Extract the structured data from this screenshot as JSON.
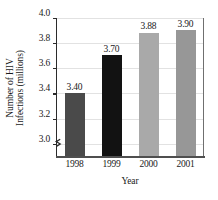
{
  "chart_data": {
    "type": "bar",
    "title": "",
    "subtitle": "",
    "xlabel": "Year",
    "ylabel": "Number of HIV Infections (millions)",
    "ylabel_line1": "Number of HIV",
    "ylabel_line2": "Infections (millions)",
    "categories": [
      "1998",
      "1999",
      "2000",
      "2001"
    ],
    "values": [
      3.4,
      3.7,
      3.88,
      3.9
    ],
    "data_labels": [
      "3.40",
      "3.70",
      "3.88",
      "3.90"
    ],
    "ylim": [
      2.9,
      4.0
    ],
    "y_axis_start_displayed": 3.0,
    "y_ticks": [
      4.0,
      3.8,
      3.6,
      3.4,
      3.2,
      3.0
    ],
    "y_tick_labels": [
      "4.0",
      "3.8",
      "3.6",
      "3.4",
      "3.2",
      "3.0"
    ],
    "grid": true,
    "grid_orientation": "horizontal",
    "legend": false,
    "legend_position": "none",
    "axis_break": true,
    "axis_break_location": "y-axis below 3.0",
    "bar_colors": [
      "#4a4a4a",
      "#121212",
      "#a9a9a9",
      "#979797"
    ],
    "bar_textures": [
      "solid-noise",
      "solid-noise",
      "checker",
      "solid"
    ],
    "background_color": "#ffffff",
    "axis_color": "#2b2b2b",
    "gridline_color": "#e2e2e2",
    "text_color": "#1a1a1a"
  }
}
